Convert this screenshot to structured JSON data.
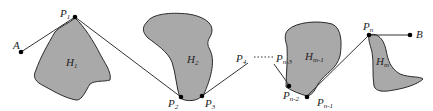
{
  "diagram": {
    "type": "path-through-obstacles",
    "colors": {
      "obstacle_fill": "#a9a9a9",
      "stroke": "#2b2b2b",
      "point": "#000000",
      "background": "#ffffff"
    },
    "points": [
      {
        "id": "A",
        "label": "A",
        "sub": ""
      },
      {
        "id": "P1",
        "label": "P",
        "sub": "1"
      },
      {
        "id": "P2",
        "label": "P",
        "sub": "2"
      },
      {
        "id": "P3",
        "label": "P",
        "sub": "3"
      },
      {
        "id": "P4",
        "label": "P",
        "sub": "4"
      },
      {
        "id": "Pn3",
        "label": "P",
        "sub": "n-3"
      },
      {
        "id": "Pn2",
        "label": "P",
        "sub": "n-2"
      },
      {
        "id": "Pn1",
        "label": "P",
        "sub": "n-1"
      },
      {
        "id": "Pn",
        "label": "P",
        "sub": "n"
      },
      {
        "id": "B",
        "label": "B",
        "sub": ""
      }
    ],
    "obstacles": [
      {
        "id": "H1",
        "label": "H",
        "sub": "1"
      },
      {
        "id": "H2",
        "label": "H",
        "sub": "2"
      },
      {
        "id": "Hm1",
        "label": "H",
        "sub": "m-1"
      },
      {
        "id": "Hm",
        "label": "H",
        "sub": "m"
      }
    ],
    "ellipsis": "......"
  }
}
